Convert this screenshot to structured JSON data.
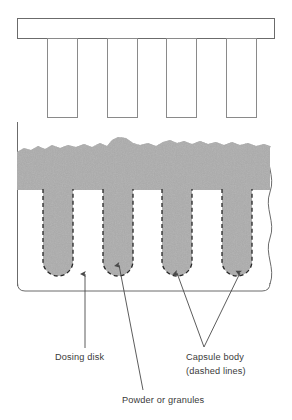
{
  "figure": {
    "background_color": "#ffffff",
    "line_color": "#6b6b6b",
    "dash_color": "#2b2b2b",
    "powder_color": "#9a9a9a",
    "label_color": "#3a3a3a"
  },
  "tamping_assembly": {
    "name": "tamping-pin-bar",
    "bar": {
      "x": 17,
      "y": 18,
      "width": 258,
      "height": 21
    },
    "pin_count": 4,
    "pins": [
      {
        "x": 47,
        "y": 39,
        "width": 31,
        "height": 79
      },
      {
        "x": 107,
        "y": 39,
        "width": 31,
        "height": 79
      },
      {
        "x": 166,
        "y": 39,
        "width": 31,
        "height": 79
      },
      {
        "x": 226,
        "y": 39,
        "width": 31,
        "height": 79
      }
    ]
  },
  "dosing_disk": {
    "name": "dosing-disk-body",
    "frame": {
      "x": 17,
      "y": 122,
      "width": 253,
      "height": 169
    },
    "break_line_side": "right"
  },
  "powder_bed": {
    "name": "powder-bed",
    "top_y": 138,
    "bottom_y": 190,
    "fill": "speckled"
  },
  "capsules": {
    "count": 4,
    "label": "Capsule body",
    "outline_style": "dashed",
    "cavities": [
      {
        "x": 43,
        "y": 190,
        "width": 30,
        "depth": 86
      },
      {
        "x": 103,
        "y": 190,
        "width": 30,
        "depth": 86
      },
      {
        "x": 162,
        "y": 190,
        "width": 30,
        "depth": 86
      },
      {
        "x": 222,
        "y": 190,
        "width": 30,
        "depth": 86
      }
    ]
  },
  "annotations": [
    {
      "id": "dosing-disk",
      "text": "Dosing disk",
      "text_x": 55,
      "text_y": 360,
      "leader": {
        "from_x": 85,
        "from_y": 348,
        "to_x": 85,
        "to_y": 272,
        "arrow": true
      }
    },
    {
      "id": "powder-or-granules",
      "text": "Powder or granules",
      "text_x": 122,
      "text_y": 403,
      "leader": {
        "from_x": 143,
        "from_y": 390,
        "to_x": 118,
        "to_y": 263,
        "arrow": true
      }
    },
    {
      "id": "capsule-body",
      "text": "Capsule body",
      "text_line2": "(dashed lines)",
      "text_x": 186,
      "text_y": 360,
      "text2_y": 374,
      "leaders": [
        {
          "from_x": 204,
          "from_y": 347,
          "to_x": 176,
          "to_y": 271,
          "arrow": true
        },
        {
          "from_x": 204,
          "from_y": 347,
          "to_x": 241,
          "to_y": 271,
          "arrow": true
        }
      ]
    }
  ]
}
